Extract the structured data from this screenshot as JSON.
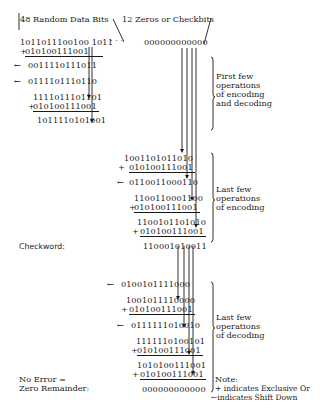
{
  "header": {
    "data_bits_label": "48 Random Data Bits",
    "ellipsis": ". . .",
    "check_bits_label": "12 Zeros or Checkbits",
    "initial_checkbits": "000000000000"
  },
  "encoding_first": {
    "lines": [
      {
        "op": "",
        "value": "1011011100100 1011"
      },
      {
        "op": "+",
        "value": "010100111001"
      },
      {
        "op": "←",
        "value": "0011110111011"
      },
      {
        "op": "←",
        "value": "0111101110110"
      },
      {
        "op": "",
        "value": "1111011101101"
      },
      {
        "op": "+",
        "value": "010100111001"
      },
      {
        "op": "",
        "value": "1011110101001"
      }
    ]
  },
  "encoding_last": {
    "lines": [
      {
        "op": "",
        "value": "1001101011010"
      },
      {
        "op": "+",
        "value": "010100111001"
      },
      {
        "op": "←",
        "value": "0110011000110"
      },
      {
        "op": "",
        "value": "1100110001100"
      },
      {
        "op": "+",
        "value": "010100111001"
      },
      {
        "op": "",
        "value": "1100101101010"
      },
      {
        "op": "+",
        "value": "010100111001"
      }
    ]
  },
  "checkword": {
    "label": "Checkword:",
    "value": "110001010011"
  },
  "decoding_last": {
    "lines": [
      {
        "op": "←",
        "value": "0100101111000"
      },
      {
        "op": "",
        "value": "1001011110000"
      },
      {
        "op": "+",
        "value": "010100111001"
      },
      {
        "op": "←",
        "value": "0111111010010"
      },
      {
        "op": "",
        "value": "1111110100101"
      },
      {
        "op": "+",
        "value": "010100111001"
      },
      {
        "op": "",
        "value": "1010100111001"
      },
      {
        "op": "+",
        "value": "010100111001"
      }
    ]
  },
  "result": {
    "label_line1": "No Error =",
    "label_line2": "Zero Remainder:",
    "value": "000000000000"
  },
  "annotations": {
    "first_few": [
      "First few",
      "operations",
      "of encoding",
      "and decoding"
    ],
    "last_encoding": [
      "Last few",
      "operations",
      "of encoding"
    ],
    "last_decoding": [
      "Last few",
      "operations",
      "of decoding"
    ]
  },
  "legend": {
    "title": "Note:",
    "xor": "+ indicates Exclusive Or",
    "shift": "←indicates Shift Down"
  }
}
